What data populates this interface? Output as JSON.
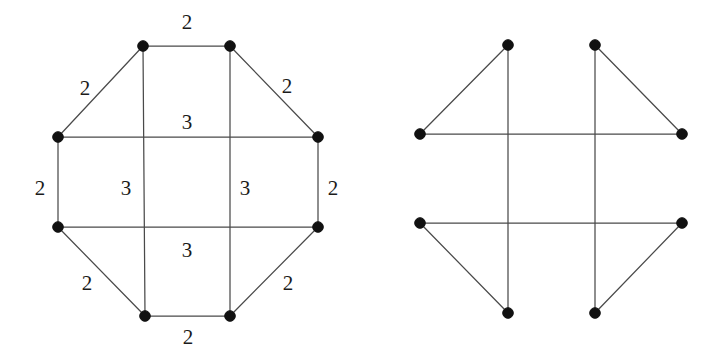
{
  "document": {
    "background_color": "#ffffff",
    "ink_color": "#1b1b1b",
    "edge_color": "#4a4a4a",
    "vertex_color": "#111111",
    "width": 720,
    "height": 356
  },
  "figures": [
    {
      "id": "left-graph",
      "name": "labeled-octagon-graph",
      "vertices": [
        {
          "id": "v1",
          "name": "top-left-vertex",
          "x": 143,
          "y": 46
        },
        {
          "id": "v2",
          "name": "top-right-vertex",
          "x": 230,
          "y": 46
        },
        {
          "id": "v3",
          "name": "right-upper-vertex",
          "x": 318,
          "y": 137
        },
        {
          "id": "v4",
          "name": "right-lower-vertex",
          "x": 318,
          "y": 227
        },
        {
          "id": "v5",
          "name": "bottom-right-vertex",
          "x": 230,
          "y": 316
        },
        {
          "id": "v6",
          "name": "bottom-left-vertex",
          "x": 145,
          "y": 316
        },
        {
          "id": "v7",
          "name": "left-lower-vertex",
          "x": 58,
          "y": 227
        },
        {
          "id": "v8",
          "name": "left-upper-vertex",
          "x": 58,
          "y": 137
        }
      ],
      "edges": [
        {
          "from": "v1",
          "to": "v2",
          "label": "2"
        },
        {
          "from": "v2",
          "to": "v3",
          "label": "2"
        },
        {
          "from": "v3",
          "to": "v4",
          "label": "2"
        },
        {
          "from": "v4",
          "to": "v5",
          "label": "2"
        },
        {
          "from": "v5",
          "to": "v6",
          "label": "2"
        },
        {
          "from": "v6",
          "to": "v7",
          "label": "2"
        },
        {
          "from": "v7",
          "to": "v8",
          "label": "2"
        },
        {
          "from": "v8",
          "to": "v1",
          "label": "2"
        },
        {
          "from": "v8",
          "to": "v3",
          "label": "3"
        },
        {
          "from": "v7",
          "to": "v4",
          "label": "3"
        },
        {
          "from": "v1",
          "to": "v6",
          "label": "3"
        },
        {
          "from": "v2",
          "to": "v5",
          "label": "3"
        }
      ],
      "labels": [
        {
          "id": "l-top",
          "name": "edge-label-top",
          "text": "2",
          "x": 187,
          "y": 22
        },
        {
          "id": "l-upper-left",
          "name": "edge-label-upper-left",
          "text": "2",
          "x": 85,
          "y": 88
        },
        {
          "id": "l-upper-right",
          "name": "edge-label-upper-right",
          "text": "2",
          "x": 287,
          "y": 86
        },
        {
          "id": "l-left",
          "name": "edge-label-left",
          "text": "2",
          "x": 40,
          "y": 188
        },
        {
          "id": "l-right",
          "name": "edge-label-right",
          "text": "2",
          "x": 333,
          "y": 188
        },
        {
          "id": "l-lower-left",
          "name": "edge-label-lower-left",
          "text": "2",
          "x": 87,
          "y": 283
        },
        {
          "id": "l-lower-right",
          "name": "edge-label-lower-right",
          "text": "2",
          "x": 288,
          "y": 283
        },
        {
          "id": "l-bottom",
          "name": "edge-label-bottom",
          "text": "2",
          "x": 188,
          "y": 337
        },
        {
          "id": "l-chord-top",
          "name": "chord-label-upper",
          "text": "3",
          "x": 187,
          "y": 122
        },
        {
          "id": "l-chord-left",
          "name": "chord-label-left-vertical",
          "text": "3",
          "x": 126,
          "y": 188
        },
        {
          "id": "l-chord-right",
          "name": "chord-label-right-vertical",
          "text": "3",
          "x": 245,
          "y": 188
        },
        {
          "id": "l-chord-bottom",
          "name": "chord-label-lower",
          "text": "3",
          "x": 187,
          "y": 250
        }
      ]
    },
    {
      "id": "right-graph",
      "name": "unlabeled-crossing-graph",
      "vertices": [
        {
          "id": "w1",
          "name": "top-left-vertex",
          "x": 508,
          "y": 45
        },
        {
          "id": "w2",
          "name": "top-right-vertex",
          "x": 595,
          "y": 45
        },
        {
          "id": "w3",
          "name": "right-upper-vertex",
          "x": 682,
          "y": 134
        },
        {
          "id": "w4",
          "name": "right-lower-vertex",
          "x": 682,
          "y": 223
        },
        {
          "id": "w5",
          "name": "bottom-right-vertex",
          "x": 595,
          "y": 313
        },
        {
          "id": "w6",
          "name": "bottom-left-vertex",
          "x": 508,
          "y": 313
        },
        {
          "id": "w7",
          "name": "left-lower-vertex",
          "x": 420,
          "y": 223
        },
        {
          "id": "w8",
          "name": "left-upper-vertex",
          "x": 420,
          "y": 134
        }
      ],
      "edges": [
        {
          "from": "w8",
          "to": "w1",
          "label": ""
        },
        {
          "from": "w2",
          "to": "w3",
          "label": ""
        },
        {
          "from": "w7",
          "to": "w6",
          "label": ""
        },
        {
          "from": "w5",
          "to": "w4",
          "label": ""
        },
        {
          "from": "w8",
          "to": "w3",
          "label": ""
        },
        {
          "from": "w7",
          "to": "w4",
          "label": ""
        },
        {
          "from": "w1",
          "to": "w6",
          "label": ""
        },
        {
          "from": "w2",
          "to": "w5",
          "label": ""
        }
      ],
      "labels": []
    }
  ]
}
